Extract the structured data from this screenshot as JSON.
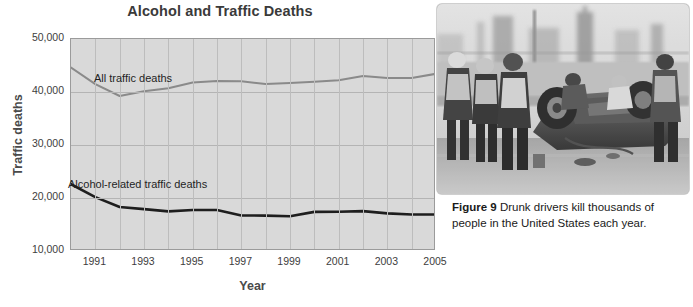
{
  "chart_data": {
    "type": "line",
    "title": "Alcohol and Traffic Deaths",
    "xlabel": "Year",
    "ylabel": "Traffic deaths",
    "xlim": [
      1990,
      2005
    ],
    "ylim": [
      10000,
      50000
    ],
    "ytick_labels": [
      "50,000",
      "40,000",
      "30,000",
      "20,000",
      "10,000"
    ],
    "ytick_values": [
      50000,
      40000,
      30000,
      20000,
      10000
    ],
    "xtick_labels": [
      "1991",
      "1993",
      "1995",
      "1997",
      "1999",
      "2001",
      "2003",
      "2005"
    ],
    "xtick_values": [
      1991,
      1993,
      1995,
      1997,
      1999,
      2001,
      2003,
      2005
    ],
    "grid": true,
    "legend_position": "inline-annotations",
    "x": [
      1990,
      1991,
      1992,
      1993,
      1994,
      1995,
      1996,
      1997,
      1998,
      1999,
      2000,
      2001,
      2002,
      2003,
      2004,
      2005
    ],
    "series": [
      {
        "name": "All traffic deaths",
        "color": "#8a8a8a",
        "values": [
          44600,
          41500,
          39250,
          40150,
          40720,
          41800,
          42060,
          42010,
          41500,
          41700,
          41950,
          42200,
          43000,
          42650,
          42640,
          43440
        ]
      },
      {
        "name": "Alcohol-related traffic deaths",
        "color": "#1e1e1e",
        "values": [
          22590,
          20160,
          18290,
          17910,
          17470,
          17730,
          17750,
          16710,
          16670,
          16570,
          17380,
          17400,
          17520,
          17100,
          16900,
          16890
        ]
      }
    ],
    "annotations": [
      {
        "text": "All traffic deaths",
        "series": "All traffic deaths"
      },
      {
        "text": "Alcohol-related traffic deaths",
        "series": "Alcohol-related traffic deaths"
      }
    ]
  },
  "figure": {
    "caption_label": "Figure 9",
    "caption_text": "Drunk drivers kill thousands of people in the United States each year.",
    "photo_alt": "black-and-white photograph of emergency responders around an overturned crashed car"
  },
  "colors": {
    "plot_background": "#d9d9d9",
    "gridline": "#b9b9b9",
    "plot_border": "#9b9b9b",
    "title_text": "#3a3a3a",
    "axis_text": "#3d3d3d",
    "page_background": "#ffffff"
  }
}
